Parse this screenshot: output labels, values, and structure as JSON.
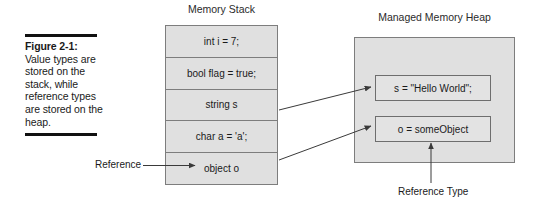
{
  "figure": {
    "caption_label": "Figure 2-1:",
    "caption_body": "Value types are stored on the stack, while reference types are stored on the heap."
  },
  "stack": {
    "title": "Memory Stack",
    "cells": [
      {
        "text": "int i = 7;"
      },
      {
        "text": "bool flag = true;"
      },
      {
        "text": "string s"
      },
      {
        "text": "char a = 'a';"
      },
      {
        "text": "object o"
      }
    ]
  },
  "heap": {
    "title": "Managed Memory Heap",
    "cells": [
      {
        "text": "s = \"Hello World\";"
      },
      {
        "text": "o = someObject"
      }
    ]
  },
  "annotations": {
    "reference": "Reference",
    "reference_type": "Reference Type"
  },
  "colors": {
    "box_fill": "#e0e0e0",
    "box_border": "#7d7d7d",
    "connector": "#4a4a4a",
    "text": "#1a1a1a",
    "rule": "#111111"
  }
}
